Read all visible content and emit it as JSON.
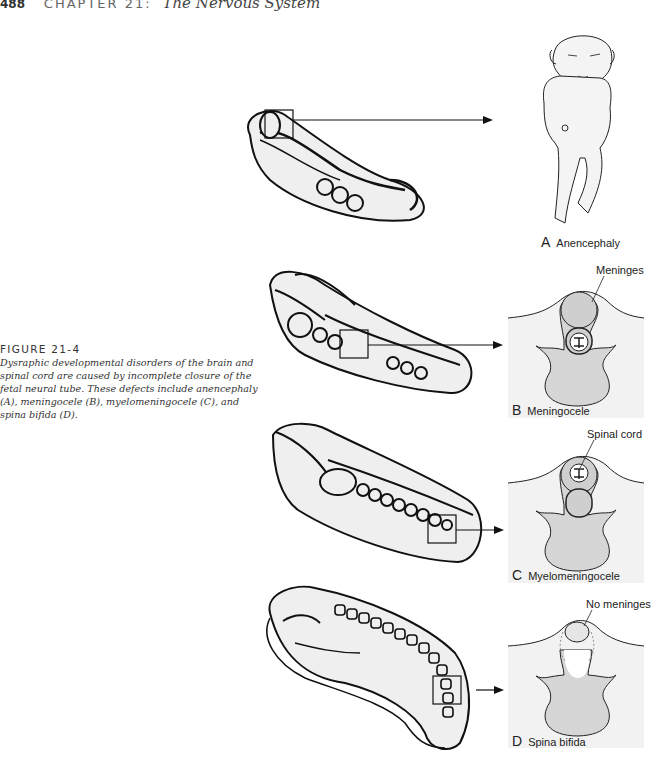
{
  "header": {
    "page_number": "488",
    "chapter": "CHAPTER 21:",
    "chapter_title": "The Nervous System"
  },
  "figure": {
    "label": "FIGURE 21-4",
    "caption": "Dysraphic developmental disorders of the brain and spinal cord are caused by incomplete closure of the fetal neural tube. These defects include anencephaly (A), meningocele (B), myelomeningocele (C), and spina bifida (D)."
  },
  "panels": [
    {
      "letter": "A",
      "name": "Anencephaly"
    },
    {
      "letter": "B",
      "name": "Meningocele",
      "annotation": "Meninges"
    },
    {
      "letter": "C",
      "name": "Myelomeningocele",
      "annotation": "Spinal cord"
    },
    {
      "letter": "D",
      "name": "Spina bifida",
      "annotation": "No meninges"
    }
  ],
  "colors": {
    "panel_bg": "#f2f2f2",
    "sac_fill": "#cfcfcf",
    "body_fill": "#d6d6d6",
    "line": "#1a1a1a"
  }
}
